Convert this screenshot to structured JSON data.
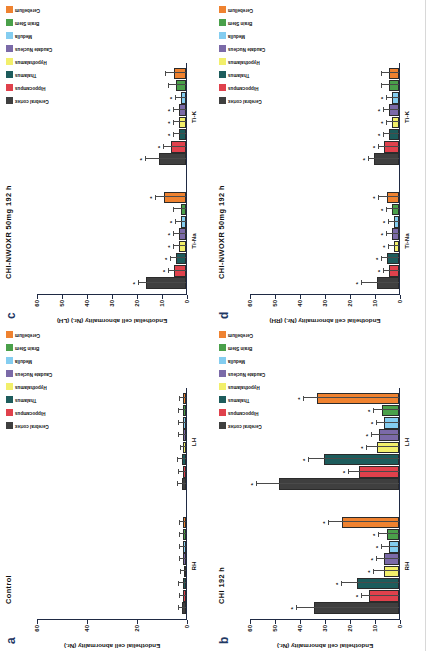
{
  "figure": {
    "yaxis_title_lh": "Endothelial cell abnormality (Nr.) (LH)",
    "yaxis_title_rh": "Endothelial cell abnormality (Nr.) (RH)",
    "yaxis_title_plain": "Endothelial cell abnormality (Nr.)"
  },
  "legend": {
    "items": [
      {
        "label": "Cerebral cortex",
        "color": "#3f3f3f"
      },
      {
        "label": "Hippocampus",
        "color": "#e0414c"
      },
      {
        "label": "Thalamus",
        "color": "#1d5c5c"
      },
      {
        "label": "Hypothalamus",
        "color": "#f2ef6b"
      },
      {
        "label": "Caudate Nucleus",
        "color": "#7b6aa8"
      },
      {
        "label": "Medulla",
        "color": "#84cdf0"
      },
      {
        "label": "Brain Stem",
        "color": "#4aa04a"
      },
      {
        "label": "Cerebellum",
        "color": "#ef8230"
      }
    ]
  },
  "chart_data": [
    {
      "panel": "a",
      "type": "bar",
      "title": "Control",
      "ylabel": "Endothelial cell abnormality (Nr.)",
      "ylim": [
        0,
        60
      ],
      "yticks": [
        0,
        20,
        40,
        60
      ],
      "groups": [
        "RH",
        "LH"
      ],
      "categories": [
        "Cerebral cortex",
        "Hippocampus",
        "Thalamus",
        "Hypothalamus",
        "Caudate Nucleus",
        "Medulla",
        "Brain Stem",
        "Cerebellum"
      ],
      "series": [
        {
          "name": "RH",
          "values": [
            1.6,
            1.2,
            1.4,
            1.0,
            1.2,
            1.1,
            1.3,
            1.2
          ],
          "errors": [
            1.2,
            1.4,
            1.6,
            1.0,
            1.3,
            1.5,
            1.2,
            1.2
          ],
          "significance": [
            "",
            "",
            "",
            "",
            "",
            "",
            "",
            ""
          ]
        },
        {
          "name": "LH",
          "values": [
            1.8,
            1.4,
            1.6,
            1.2,
            1.3,
            1.2,
            1.4,
            1.3
          ],
          "errors": [
            1.3,
            1.4,
            1.5,
            1.0,
            1.4,
            1.5,
            1.4,
            1.2
          ],
          "significance": [
            "",
            "",
            "",
            "",
            "",
            "",
            "",
            ""
          ]
        }
      ]
    },
    {
      "panel": "b",
      "type": "bar",
      "title": "CHI 192 h",
      "ylabel": "Endothelial cell abnormality (Nr.)",
      "ylim": [
        0,
        60
      ],
      "yticks": [
        0,
        10,
        20,
        30,
        40,
        50,
        60
      ],
      "groups": [
        "RH",
        "LH"
      ],
      "categories": [
        "Cerebral cortex",
        "Hippocampus",
        "Thalamus",
        "Hypothalamus",
        "Caudate Nucleus",
        "Medulla",
        "Brain Stem",
        "Cerebellum"
      ],
      "series": [
        {
          "name": "RH",
          "values": [
            34,
            12,
            17,
            6,
            6,
            4,
            5,
            23
          ],
          "errors": [
            7,
            3,
            6,
            4,
            3,
            3,
            3,
            5
          ],
          "significance": [
            "*",
            "*",
            "*",
            "*",
            "*",
            "*",
            "*",
            "*"
          ]
        },
        {
          "name": "LH",
          "values": [
            48,
            16,
            30,
            9,
            8,
            6,
            7,
            33
          ],
          "errors": [
            9,
            4,
            6,
            4,
            3,
            3,
            3,
            5
          ],
          "significance": [
            "*",
            "*",
            "*",
            "*",
            "*",
            "*",
            "*",
            "*"
          ]
        }
      ]
    },
    {
      "panel": "c",
      "type": "bar",
      "title": "CHI-NWOXR 50mg 192 h",
      "ylabel": "Endothelial cell abnormality (Nr.) (LH)",
      "ylim": [
        0,
        60
      ],
      "yticks": [
        0,
        10,
        20,
        30,
        40,
        50,
        60
      ],
      "groups": [
        "Ti-Na",
        "Ti-K"
      ],
      "categories": [
        "Cerebral cortex",
        "Hippocampus",
        "Thalamus",
        "Hypothalamus",
        "Caudate Nucleus",
        "Medulla",
        "Brain Stem",
        "Cerebellum"
      ],
      "series": [
        {
          "name": "Ti-Na",
          "values": [
            16,
            5,
            4,
            3,
            3,
            2,
            2,
            9
          ],
          "errors": [
            3,
            2,
            2,
            2,
            2,
            2,
            3,
            3
          ],
          "significance": [
            "*",
            "*",
            "*",
            "*",
            "*",
            "*",
            "",
            "*"
          ]
        },
        {
          "name": "Ti-K",
          "values": [
            11,
            6,
            3,
            3,
            3,
            2,
            4,
            5
          ],
          "errors": [
            5,
            3,
            2,
            2,
            2,
            2,
            3,
            3
          ],
          "significance": [
            "*",
            "*",
            "*",
            "*",
            "*",
            "*",
            "",
            ""
          ]
        }
      ]
    },
    {
      "panel": "d",
      "type": "bar",
      "title": "CHI-NWOXR 50mg 192 h",
      "ylabel": "Endothelial cell abnormality (Nr.) (RH)",
      "ylim": [
        0,
        60
      ],
      "yticks": [
        0,
        10,
        20,
        30,
        40,
        50,
        60
      ],
      "groups": [
        "Ti-Na",
        "Ti-K"
      ],
      "categories": [
        "Cerebral cortex",
        "Hippocampus",
        "Thalamus",
        "Hypothalamus",
        "Caudate Nucleus",
        "Medulla",
        "Brain Stem",
        "Cerebellum"
      ],
      "series": [
        {
          "name": "Ti-Na",
          "values": [
            9,
            4,
            5,
            2,
            3,
            2,
            3,
            5
          ],
          "errors": [
            6,
            2,
            2,
            2,
            2,
            2,
            2,
            3
          ],
          "significance": [
            "*",
            "*",
            "*",
            "*",
            "*",
            "*",
            "*",
            "*"
          ]
        },
        {
          "name": "Ti-K",
          "values": [
            10,
            6,
            4,
            3,
            4,
            3,
            4,
            4
          ],
          "errors": [
            2,
            2,
            2,
            2,
            2,
            2,
            3,
            3
          ],
          "significance": [
            "*",
            "*",
            "*",
            "*",
            "*",
            "*",
            "",
            ""
          ]
        }
      ]
    }
  ],
  "panel_labels": {
    "a": "a",
    "b": "b",
    "c": "c",
    "d": "d"
  }
}
